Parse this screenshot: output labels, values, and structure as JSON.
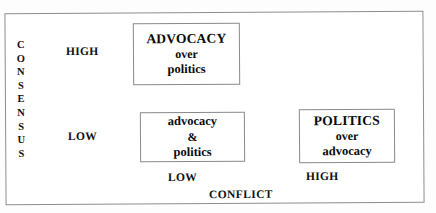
{
  "figure": {
    "type": "2x2-matrix-diagram",
    "border_color": "#8d8d8d",
    "background_color": "#ffffff",
    "text_color": "#111111"
  },
  "y_axis": {
    "title": "CONSENSUS",
    "letters": [
      "C",
      "O",
      "N",
      "S",
      "E",
      "N",
      "S",
      "U",
      "S"
    ],
    "levels": {
      "high": "HIGH",
      "low": "LOW"
    }
  },
  "x_axis": {
    "title": "CONFLICT",
    "levels": {
      "low": "LOW",
      "high": "HIGH"
    }
  },
  "cells": {
    "high_consensus_low_conflict": {
      "primary": "ADVOCACY",
      "connector": "over",
      "secondary": "politics"
    },
    "low_consensus_low_conflict": {
      "primary": "advocacy",
      "connector": "&",
      "secondary": "politics"
    },
    "low_consensus_high_conflict": {
      "primary": "POLITICS",
      "connector": "over",
      "secondary": "advocacy"
    }
  }
}
